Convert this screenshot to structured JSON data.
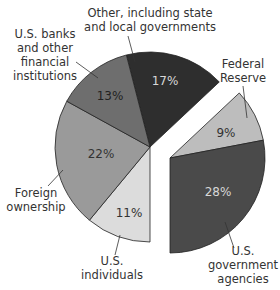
{
  "chart_data": {
    "type": "pie",
    "title": "",
    "exploded": [
      "Federal Reserve",
      "U.S. government agencies"
    ],
    "slices": [
      {
        "key": "other",
        "label": "Other, including state and local governments",
        "label_lines": [
          "Other, including state",
          "and local governments"
        ],
        "value": 17,
        "display": "17%",
        "color": "#2e2e2e",
        "text_color": "#d8d8d8"
      },
      {
        "key": "fed",
        "label": "Federal Reserve",
        "label_lines": [
          "Federal",
          "Reserve"
        ],
        "value": 9,
        "display": "9%",
        "color": "#bdbdbd",
        "text_color": "#333333"
      },
      {
        "key": "agencies",
        "label": "U.S. government agencies",
        "label_lines": [
          "U.S.",
          "government",
          "agencies"
        ],
        "value": 28,
        "display": "28%",
        "color": "#4a4a4a",
        "text_color": "#d8d8d8"
      },
      {
        "key": "individuals",
        "label": "U.S. individuals",
        "label_lines": [
          "U.S.",
          "individuals"
        ],
        "value": 11,
        "display": "11%",
        "color": "#dcdcdc",
        "text_color": "#333333"
      },
      {
        "key": "foreign",
        "label": "Foreign ownership",
        "label_lines": [
          "Foreign",
          "ownership"
        ],
        "value": 22,
        "display": "22%",
        "color": "#9a9a9a",
        "text_color": "#333333"
      },
      {
        "key": "banks",
        "label": "U.S. banks and other financial institutions",
        "label_lines": [
          "U.S. banks",
          "and other",
          "financial",
          "institutions"
        ],
        "value": 13,
        "display": "13%",
        "color": "#6e6e6e",
        "text_color": "#222222"
      }
    ]
  }
}
